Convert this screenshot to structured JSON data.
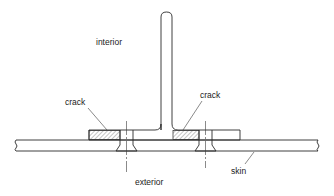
{
  "figure": {
    "labels": {
      "interior": "interior",
      "exterior": "exterior",
      "crack_left": "crack",
      "crack_right": "crack",
      "skin": "skin"
    },
    "components": [
      "stringer",
      "flange",
      "skin",
      "fastener-left",
      "fastener-right",
      "crack-region-left",
      "crack-region-right"
    ],
    "colors": {
      "line": "#2a2a2a",
      "background": "#ffffff"
    }
  }
}
